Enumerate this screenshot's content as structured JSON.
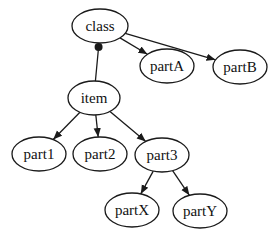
{
  "diagram": {
    "type": "tree",
    "nodes": [
      {
        "id": "class",
        "label": "class",
        "x": 100,
        "y": 26,
        "rx": 28,
        "ry": 17
      },
      {
        "id": "partA",
        "label": "partA",
        "x": 167,
        "y": 66,
        "rx": 27,
        "ry": 17
      },
      {
        "id": "partB",
        "label": "partB",
        "x": 240,
        "y": 67,
        "rx": 27,
        "ry": 17
      },
      {
        "id": "item",
        "label": "item",
        "x": 94,
        "y": 98,
        "rx": 26,
        "ry": 17
      },
      {
        "id": "part1",
        "label": "part1",
        "x": 39,
        "y": 154,
        "rx": 27,
        "ry": 17
      },
      {
        "id": "part2",
        "label": "part2",
        "x": 100,
        "y": 154,
        "rx": 27,
        "ry": 17
      },
      {
        "id": "part3",
        "label": "part3",
        "x": 162,
        "y": 155,
        "rx": 27,
        "ry": 17
      },
      {
        "id": "partX",
        "label": "partX",
        "x": 132,
        "y": 210,
        "rx": 27,
        "ry": 17
      },
      {
        "id": "partY",
        "label": "partY",
        "x": 200,
        "y": 211,
        "rx": 27,
        "ry": 17
      }
    ],
    "edges": [
      {
        "from": "class",
        "to": "partA",
        "head": "arrow"
      },
      {
        "from": "class",
        "to": "partB",
        "head": "arrow"
      },
      {
        "from": "class",
        "to": "item",
        "head": "dot-at-source"
      },
      {
        "from": "item",
        "to": "part1",
        "head": "arrow"
      },
      {
        "from": "item",
        "to": "part2",
        "head": "arrow"
      },
      {
        "from": "item",
        "to": "part3",
        "head": "arrow"
      },
      {
        "from": "part3",
        "to": "partX",
        "head": "arrow"
      },
      {
        "from": "part3",
        "to": "partY",
        "head": "arrow"
      }
    ]
  }
}
